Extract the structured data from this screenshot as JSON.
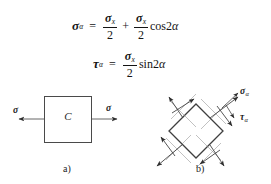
{
  "equations": [
    {
      "id": "normal-stress-equation",
      "lhs_symbol": "σ",
      "lhs_sub": "α",
      "equals": "=",
      "term1_num_symbol": "σ",
      "term1_num_sub": "x",
      "term1_den": "2",
      "operator": "+",
      "term2_num_symbol": "σ",
      "term2_num_sub": "x",
      "term2_den": "2",
      "trig": "cos2",
      "trig_angle": "α"
    },
    {
      "id": "shear-stress-equation",
      "lhs_symbol": "τ",
      "lhs_sub": "α",
      "equals": "=",
      "term1_num_symbol": "σ",
      "term1_num_sub": "x",
      "term1_den": "2",
      "trig": "sin2",
      "trig_angle": "α"
    }
  ],
  "figure_a": {
    "center_label": "C",
    "left_stress_symbol": "σ",
    "right_stress_symbol": "σ",
    "caption": "a)"
  },
  "figure_b": {
    "normal_stress_symbol": "σ",
    "normal_stress_sub": "α",
    "shear_stress_symbol": "τ",
    "shear_stress_sub": "α",
    "caption": "b)"
  },
  "colors": {
    "ink": "#1a1a1a",
    "outline": "#4a4a4a",
    "arrow": "#333333",
    "background": "#ffffff"
  }
}
